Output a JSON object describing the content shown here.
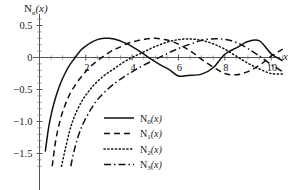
{
  "chart_data": {
    "type": "line",
    "title": "",
    "ylabel": "N_n(x)",
    "xlabel": "x",
    "xlim": [
      0,
      10.6
    ],
    "ylim": [
      -1.72,
      0.68
    ],
    "grid": false,
    "legend_position": "lower-center",
    "x_ticks": [
      2,
      4,
      6,
      8,
      10
    ],
    "x_tick_labels": [
      "2",
      "4",
      "6",
      "8",
      "10"
    ],
    "y_ticks": [
      0.5,
      0,
      -0.5,
      -1.0,
      -1.5
    ],
    "y_tick_labels": [
      "0.5",
      "0",
      "-0.5",
      "-1.0",
      "-1.5"
    ],
    "series": [
      {
        "name": "N0(x)",
        "label_base": "N",
        "label_sub": "0",
        "label_arg": "(x)",
        "style": "solid",
        "color": "#111111",
        "x": [
          0.25,
          0.4,
          0.55,
          0.7,
          0.9,
          1.1,
          1.3,
          1.5,
          1.8,
          2.0,
          2.2,
          2.5,
          2.8,
          3.0,
          3.4,
          3.8,
          4.0,
          4.4,
          4.8,
          5.2,
          5.6,
          6.0,
          6.4,
          7.0,
          7.5,
          8.0,
          8.5,
          9.0,
          9.5,
          10.0,
          10.5
        ],
        "y": [
          -1.47,
          -1.08,
          -0.82,
          -0.62,
          -0.41,
          -0.25,
          -0.12,
          -0.02,
          0.12,
          0.18,
          0.23,
          0.28,
          0.3,
          0.3,
          0.27,
          0.21,
          0.17,
          0.08,
          -0.02,
          -0.11,
          -0.19,
          -0.29,
          -0.28,
          -0.26,
          -0.16,
          0.05,
          0.15,
          0.25,
          0.26,
          0.06,
          -0.05
        ]
      },
      {
        "name": "N1(x)",
        "label_base": "N",
        "label_sub": "1",
        "label_arg": "(x)",
        "style": "dashed",
        "color": "#111111",
        "x": [
          0.55,
          0.7,
          0.9,
          1.1,
          1.3,
          1.6,
          1.9,
          2.2,
          2.5,
          2.8,
          3.1,
          3.4,
          3.8,
          4.2,
          4.6,
          5.0,
          5.4,
          5.8,
          6.2,
          6.6,
          7.0,
          7.5,
          8.0,
          8.5,
          9.0,
          9.5,
          10.0,
          10.5
        ],
        "y": [
          -1.7,
          -1.3,
          -0.97,
          -0.75,
          -0.58,
          -0.4,
          -0.26,
          -0.14,
          -0.05,
          0.03,
          0.1,
          0.15,
          0.22,
          0.26,
          0.29,
          0.3,
          0.28,
          0.24,
          0.17,
          0.08,
          -0.03,
          -0.15,
          -0.25,
          -0.27,
          -0.22,
          -0.12,
          0.02,
          0.13
        ]
      },
      {
        "name": "N2(x)",
        "label_base": "N",
        "label_sub": "2",
        "label_arg": "(x)",
        "style": "dotted",
        "color": "#111111",
        "x": [
          0.95,
          1.1,
          1.3,
          1.5,
          1.8,
          2.1,
          2.4,
          2.8,
          3.2,
          3.6,
          4.0,
          4.4,
          4.8,
          5.2,
          5.6,
          6.0,
          6.4,
          6.8,
          7.2,
          7.6,
          8.0,
          8.5,
          9.0,
          9.5,
          10.0,
          10.5
        ],
        "y": [
          -1.7,
          -1.45,
          -1.15,
          -0.93,
          -0.7,
          -0.54,
          -0.41,
          -0.28,
          -0.18,
          -0.08,
          0.0,
          0.07,
          0.14,
          0.2,
          0.25,
          0.28,
          0.29,
          0.28,
          0.25,
          0.2,
          0.13,
          0.02,
          -0.09,
          -0.18,
          -0.25,
          -0.26
        ]
      },
      {
        "name": "N3(x)",
        "label_base": "N",
        "label_sub": "3",
        "label_arg": "(x)",
        "style": "dashdot",
        "color": "#111111",
        "x": [
          1.35,
          1.5,
          1.7,
          1.9,
          2.2,
          2.5,
          2.9,
          3.3,
          3.7,
          4.1,
          4.5,
          5.0,
          5.4,
          5.8,
          6.2,
          6.6,
          7.0,
          7.4,
          7.8,
          8.2,
          8.6,
          9.0,
          9.5,
          10.0,
          10.5
        ],
        "y": [
          -1.7,
          -1.45,
          -1.2,
          -1.02,
          -0.82,
          -0.66,
          -0.51,
          -0.39,
          -0.29,
          -0.2,
          -0.12,
          -0.03,
          0.04,
          0.11,
          0.17,
          0.22,
          0.27,
          0.29,
          0.29,
          0.27,
          0.22,
          0.14,
          0.02,
          -0.11,
          -0.22
        ]
      }
    ]
  }
}
